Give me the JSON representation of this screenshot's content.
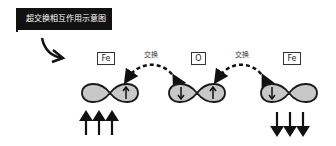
{
  "title": "超交换相互作用示意图",
  "atoms": [
    {
      "label": "Fe",
      "orbital_spins": [
        "",
        "up"
      ],
      "net_spin": "up"
    },
    {
      "label": "O",
      "orbital_spins": [
        "down",
        "up"
      ],
      "net_spin": ""
    },
    {
      "label": "Fe",
      "orbital_spins": [
        "down",
        ""
      ],
      "net_spin": "down"
    }
  ],
  "exchange_labels": [
    "交换",
    "交换"
  ],
  "colors": {
    "orbital_fill": "#c8c8c8",
    "stroke": "#1a1a1a",
    "banner": "#111111"
  }
}
